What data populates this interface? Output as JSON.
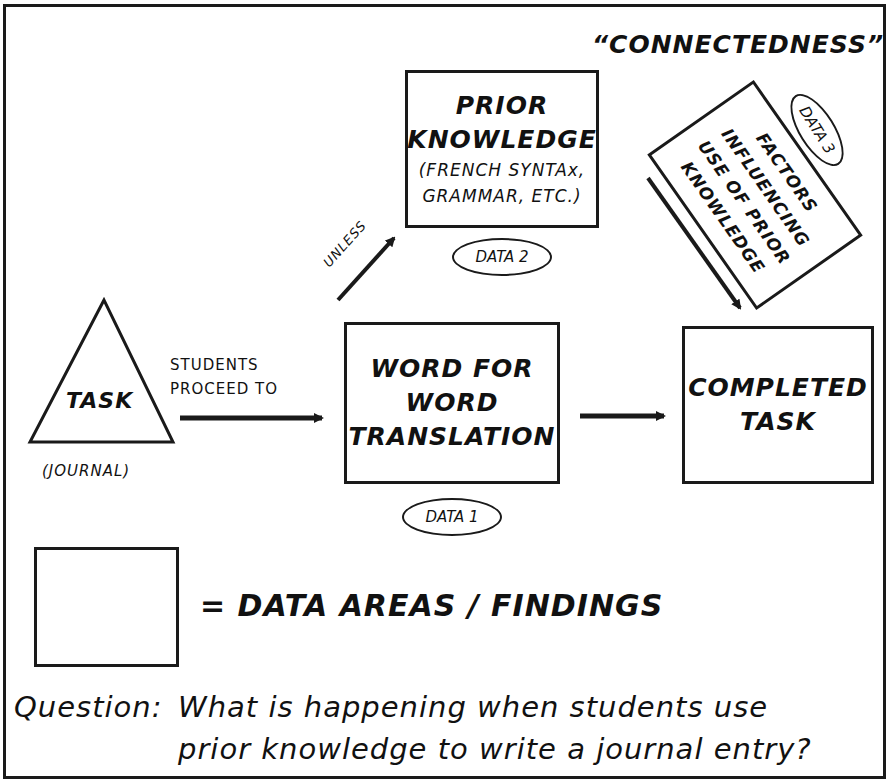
{
  "diagram": {
    "title": "“CONNECTEDNESS”",
    "nodes": {
      "task": {
        "label": "TASK",
        "sublabel": "(JOURNAL)",
        "shape": "triangle"
      },
      "prior_knowledge": {
        "line1": "PRIOR",
        "line2": "KNOWLEDGE",
        "line3": "(FRENCH SYNTAx,",
        "line4": "GRAMMAR, ETC.)",
        "badge": "DATA 2"
      },
      "word_for_word": {
        "line1": "WORD FOR",
        "line2": "WORD",
        "line3": "TRANSLATION",
        "badge": "DATA 1"
      },
      "completed_task": {
        "line1": "COMPLETED",
        "line2": "TASK"
      },
      "factors": {
        "line1": "FACTORS",
        "line2": "INFLUENCING",
        "line3": "USE OF PRIOR",
        "line4": "KNOWLEDGE",
        "badge": "DATA 3"
      }
    },
    "edges": {
      "task_to_word": {
        "label_line1": "STUDENTS",
        "label_line2": "PROCEED TO"
      },
      "word_to_prior": {
        "label": "UNLESS"
      },
      "word_to_completed": {
        "label": ""
      },
      "factors_to_completed": {
        "label": ""
      }
    },
    "legend": {
      "text": "= DATA AREAS / FINDINGS"
    },
    "question": {
      "prefix": "Question:",
      "line1": "What is happening when students use",
      "line2": "prior knowledge to write a journal entry?"
    }
  },
  "colors": {
    "ink": "#1a1a1a",
    "background": "#ffffff"
  }
}
